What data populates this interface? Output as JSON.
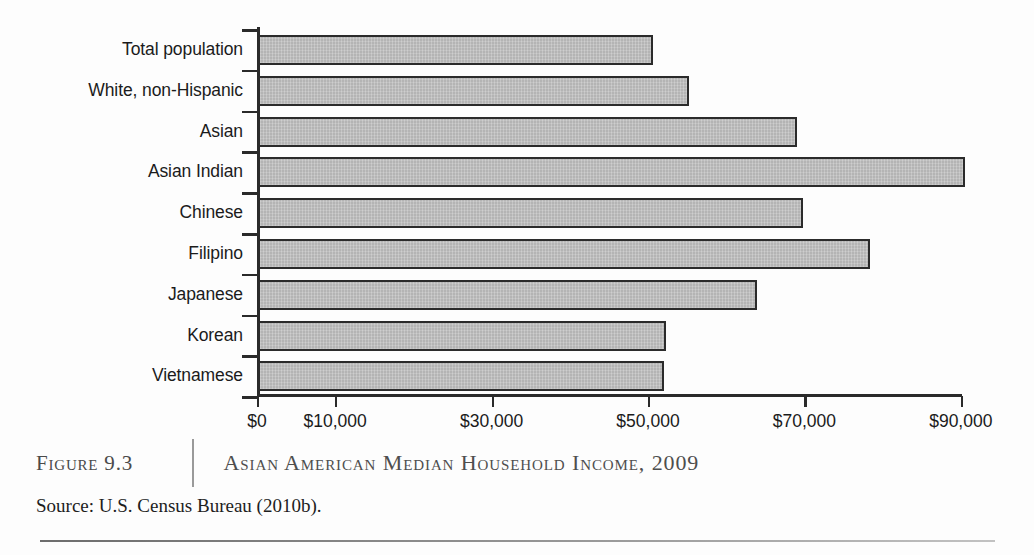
{
  "figure": {
    "number_label": "Figure 9.3",
    "title": "Asian American Median Household Income, 2009",
    "source": "Source: U.S. Census Bureau (2010b)."
  },
  "chart_data": {
    "type": "bar",
    "orientation": "horizontal",
    "title": "Asian American Median Household Income, 2009",
    "xlabel": "",
    "ylabel": "",
    "xlim": [
      0,
      100000
    ],
    "grid": false,
    "legend": null,
    "bar_color": "#b4b4b4",
    "bar_border_color": "#2b2b2b",
    "axis_color": "#2a2a2a",
    "tick_values": [
      0,
      10000,
      30000,
      50000,
      70000,
      90000
    ],
    "tick_labels": [
      "$0",
      "$10,000",
      "$30,000",
      "$50,000",
      "$70,000",
      "$90,000"
    ],
    "categories": [
      "Total population",
      "White, non-Hispanic",
      "Asian",
      "Asian Indian",
      "Chinese",
      "Filipino",
      "Japanese",
      "Korean",
      "Vietnamese"
    ],
    "values": [
      50500,
      55100,
      68900,
      90400,
      69700,
      78200,
      63800,
      52200,
      51900
    ]
  }
}
